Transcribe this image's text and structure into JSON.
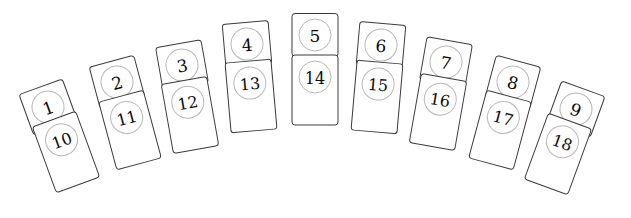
{
  "scene": {
    "title": "Domino Fan Layout",
    "background_color": "#ffffff",
    "width": 631,
    "height": 218,
    "card_stroke_color": "#3a3a3a",
    "card_fill_color": "#ffffff",
    "pip_circle_color": "#b8b8b8",
    "pip_text_color": "#0a0a0a",
    "tile_count": 9
  },
  "chart_data": {
    "type": "table",
    "xlabel": "",
    "ylabel": "",
    "categories": [
      "Tile 1",
      "Tile 2",
      "Tile 3",
      "Tile 4",
      "Tile 5",
      "Tile 6",
      "Tile 7",
      "Tile 8",
      "Tile 9"
    ],
    "series": [
      {
        "name": "top",
        "values": [
          1,
          2,
          3,
          4,
          5,
          6,
          7,
          8,
          9
        ]
      },
      {
        "name": "bottom",
        "values": [
          10,
          11,
          12,
          13,
          14,
          15,
          16,
          17,
          18
        ]
      }
    ]
  },
  "tiles": [
    {
      "id": "tile-1",
      "top_label": "1",
      "bottom_label": "10",
      "top": {
        "cx": 48,
        "cy": 107,
        "w": 46,
        "h": 43,
        "angle": -20
      },
      "bottom": {
        "cx": 66,
        "cy": 152,
        "w": 46,
        "h": 70,
        "angle": -20
      }
    },
    {
      "id": "tile-2",
      "top_label": "2",
      "bottom_label": "11",
      "top": {
        "cx": 117,
        "cy": 82,
        "w": 46,
        "h": 43,
        "angle": -15
      },
      "bottom": {
        "cx": 130,
        "cy": 130,
        "w": 46,
        "h": 70,
        "angle": -15
      }
    },
    {
      "id": "tile-3",
      "top_label": "3",
      "bottom_label": "12",
      "top": {
        "cx": 182,
        "cy": 65,
        "w": 46,
        "h": 43,
        "angle": -10
      },
      "bottom": {
        "cx": 190,
        "cy": 115,
        "w": 46,
        "h": 70,
        "angle": -10
      }
    },
    {
      "id": "tile-4",
      "top_label": "4",
      "bottom_label": "13",
      "top": {
        "cx": 247,
        "cy": 44,
        "w": 46,
        "h": 43,
        "angle": -5
      },
      "bottom": {
        "cx": 251,
        "cy": 96,
        "w": 46,
        "h": 70,
        "angle": -5
      }
    },
    {
      "id": "tile-5",
      "top_label": "5",
      "bottom_label": "14",
      "top": {
        "cx": 315,
        "cy": 35,
        "w": 46,
        "h": 43,
        "angle": 0
      },
      "bottom": {
        "cx": 315,
        "cy": 90,
        "w": 46,
        "h": 70,
        "angle": 0
      }
    },
    {
      "id": "tile-6",
      "top_label": "6",
      "bottom_label": "15",
      "top": {
        "cx": 381,
        "cy": 45,
        "w": 46,
        "h": 43,
        "angle": 5
      },
      "bottom": {
        "cx": 377,
        "cy": 97,
        "w": 46,
        "h": 70,
        "angle": 5
      }
    },
    {
      "id": "tile-7",
      "top_label": "7",
      "bottom_label": "16",
      "top": {
        "cx": 446,
        "cy": 62,
        "w": 46,
        "h": 43,
        "angle": 10
      },
      "bottom": {
        "cx": 438,
        "cy": 112,
        "w": 46,
        "h": 70,
        "angle": 10
      }
    },
    {
      "id": "tile-8",
      "top_label": "8",
      "bottom_label": "17",
      "top": {
        "cx": 513,
        "cy": 82,
        "w": 46,
        "h": 43,
        "angle": 15
      },
      "bottom": {
        "cx": 500,
        "cy": 130,
        "w": 46,
        "h": 70,
        "angle": 15
      }
    },
    {
      "id": "tile-9",
      "top_label": "9",
      "bottom_label": "18",
      "top": {
        "cx": 576,
        "cy": 109,
        "w": 46,
        "h": 43,
        "angle": 20
      },
      "bottom": {
        "cx": 558,
        "cy": 154,
        "w": 46,
        "h": 70,
        "angle": 20
      }
    }
  ]
}
